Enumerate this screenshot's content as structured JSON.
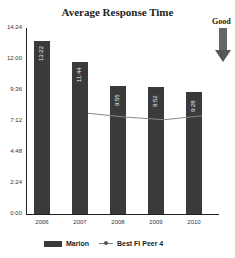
{
  "chart_data": {
    "type": "bar",
    "title": "Average Response Time",
    "xlabel": "",
    "ylabel": "",
    "categories": [
      "2006",
      "2007",
      "2008",
      "2009",
      "2010"
    ],
    "y_ticks": [
      "0:00",
      "2:24",
      "4:48",
      "7:12",
      "9:36",
      "12:00",
      "14:24"
    ],
    "ylim": [
      "0:00",
      "14:24"
    ],
    "series": [
      {
        "name": "Marion",
        "type": "bar",
        "values": [
          "13:22",
          "11:44",
          "9:55",
          "9:52",
          "9:28"
        ],
        "values_minutes": [
          13.37,
          11.73,
          9.92,
          9.87,
          9.47
        ]
      },
      {
        "name": "Best FI Peer 4",
        "type": "line",
        "values_minutes": [
          null,
          7.8,
          7.5,
          7.3,
          7.6
        ]
      }
    ],
    "annotation": "Good",
    "legend_position": "bottom",
    "grid": false
  },
  "title": "Average Response Time",
  "annotation": "Good",
  "legend": {
    "bar": "Marion",
    "line": "Best FI Peer 4"
  }
}
